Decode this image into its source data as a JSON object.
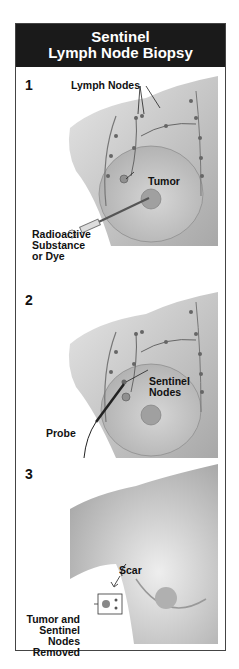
{
  "title": {
    "line1": "Sentinel",
    "line2": "Lymph Node Biopsy"
  },
  "steps": [
    {
      "number": "1",
      "labels": {
        "lymph_nodes": "Lymph Nodes",
        "tumor": "Tumor",
        "injection_line1": "Radioactive",
        "injection_line2": "Substance",
        "injection_line3": "or Dye"
      }
    },
    {
      "number": "2",
      "labels": {
        "sentinel_line1": "Sentinel",
        "sentinel_line2": "Nodes",
        "probe": "Probe"
      }
    },
    {
      "number": "3",
      "labels": {
        "scar": "Scar",
        "removed_line1": "Tumor and",
        "removed_line2": "Sentinel",
        "removed_line3": "Nodes",
        "removed_line4": "Removed"
      }
    }
  ],
  "colors": {
    "header_bg": "#1a1a1a",
    "header_text": "#ffffff",
    "skin_light": "#d9d9d9",
    "skin_dark": "#9a9a9a",
    "border": "#444444"
  }
}
